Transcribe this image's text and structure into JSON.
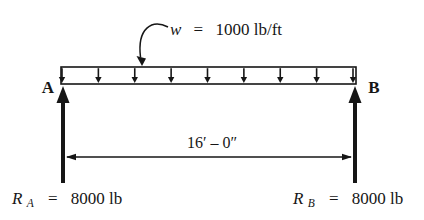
{
  "diagram": {
    "type": "simply-supported-beam-with-uniform-load",
    "load_label": {
      "symbol": "w",
      "equals": "=",
      "value": "1000 lb/ft"
    },
    "node_a": "A",
    "node_b": "B",
    "span_label": "16′ – 0″",
    "reaction_a": {
      "symbol": "R",
      "subscript": "A",
      "equals": "=",
      "value": "8000 lb"
    },
    "reaction_b": {
      "symbol": "R",
      "subscript": "B",
      "equals": "=",
      "value": "8000 lb"
    },
    "load_arrow_count": 9,
    "colors": {
      "ink": "#161616",
      "background": "#ffffff"
    }
  }
}
